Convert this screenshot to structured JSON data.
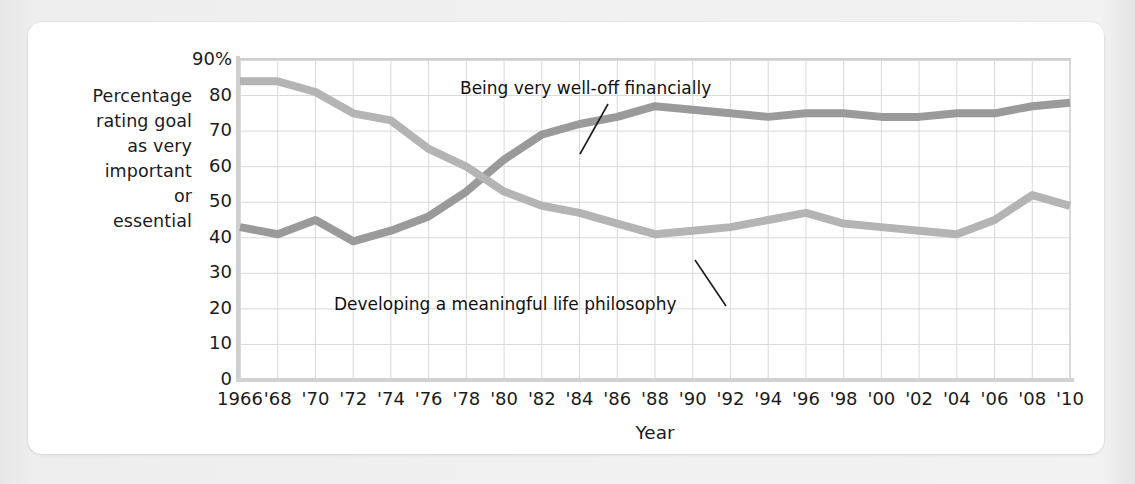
{
  "figure": {
    "y_axis_caption_lines": [
      "Percentage",
      "rating goal",
      "as very",
      "important",
      "or",
      "essential"
    ],
    "x_axis_title": "Year",
    "annotations": {
      "series_a": "Being very well-off financially",
      "series_b": "Developing a meaningful life philosophy"
    },
    "colors": {
      "series_a_line": "#9a9a9a",
      "series_b_line": "#b4b4b4",
      "grid": "#d9d9d9",
      "axis": "#cfcfcf",
      "text": "#1b1b1b",
      "card": "#ffffff",
      "page": "#ececec"
    }
  },
  "chart_data": {
    "type": "line",
    "title": "",
    "subtitle": "",
    "xlabel": "Year",
    "ylabel": "Percentage rating goal as very important or essential",
    "xlim": [
      1966,
      2010
    ],
    "ylim": [
      0,
      90
    ],
    "ytick_values": [
      0,
      10,
      20,
      30,
      40,
      50,
      60,
      70,
      80,
      90
    ],
    "ytick_labels": [
      "0",
      "10",
      "20",
      "30",
      "40",
      "50",
      "60",
      "70",
      "80",
      "90%"
    ],
    "grid": true,
    "legend": "inline-annotations",
    "x": [
      1966,
      1968,
      1970,
      1972,
      1974,
      1976,
      1978,
      1980,
      1982,
      1984,
      1986,
      1988,
      1990,
      1992,
      1994,
      1996,
      1998,
      2000,
      2002,
      2004,
      2006,
      2008,
      2010
    ],
    "xtick_labels": [
      "1966",
      "'68",
      "'70",
      "'72",
      "'74",
      "'76",
      "'78",
      "'80",
      "'82",
      "'84",
      "'86",
      "'88",
      "'90",
      "'92",
      "'94",
      "'96",
      "'98",
      "'00",
      "'02",
      "'04",
      "'06",
      "'08",
      "'10"
    ],
    "series": [
      {
        "name": "Being very well-off financially",
        "color": "#9a9a9a",
        "values": [
          43,
          41,
          45,
          39,
          42,
          46,
          53,
          62,
          69,
          72,
          74,
          77,
          76,
          75,
          74,
          75,
          75,
          74,
          74,
          75,
          75,
          77,
          78
        ]
      },
      {
        "name": "Developing a meaningful life philosophy",
        "color": "#b4b4b4",
        "values": [
          84,
          84,
          81,
          75,
          73,
          65,
          60,
          53,
          49,
          47,
          44,
          41,
          42,
          43,
          45,
          47,
          44,
          43,
          42,
          41,
          45,
          52,
          49
        ]
      }
    ]
  }
}
